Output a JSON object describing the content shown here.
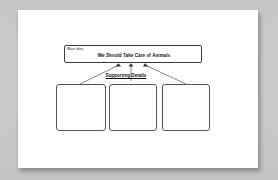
{
  "document": {
    "type": "graphic-organizer-worksheet",
    "page_background": "#ffffff",
    "canvas_background": "#c9c9c9"
  },
  "organizer": {
    "main_idea": {
      "label": "Main Idea",
      "title": "We Should Take Care of Animals"
    },
    "supporting_details": {
      "heading": "Supporting Details",
      "boxes": [
        {
          "text": ""
        },
        {
          "text": ""
        },
        {
          "text": ""
        }
      ]
    },
    "connectors": {
      "count": 3,
      "style": "arrow",
      "color": "#333333",
      "direction": "details-to-main-idea"
    }
  }
}
